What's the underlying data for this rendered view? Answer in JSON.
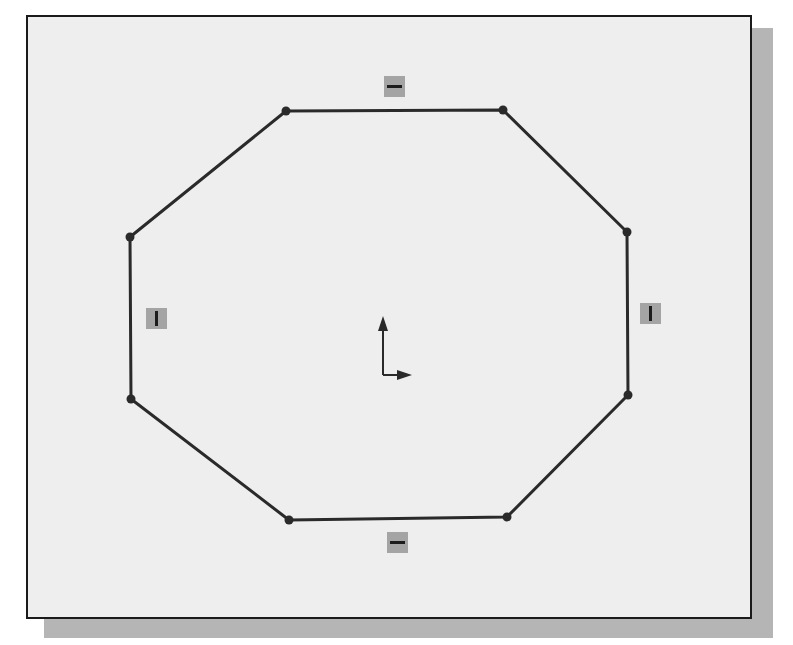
{
  "figure": {
    "colors": {
      "line": "#2a2a2a",
      "background": "#eeeeee",
      "frame_border": "#1a1a1a",
      "shadow": "#b5b5b5",
      "badge_fill": "#a4a4a4"
    },
    "octagon": {
      "vertices": [
        {
          "name": "top-left",
          "x": 286,
          "y": 111
        },
        {
          "name": "top-right",
          "x": 503,
          "y": 110
        },
        {
          "name": "right-top",
          "x": 627,
          "y": 232
        },
        {
          "name": "right-bottom",
          "x": 628,
          "y": 395
        },
        {
          "name": "bottom-right",
          "x": 507,
          "y": 517
        },
        {
          "name": "bottom-left",
          "x": 289,
          "y": 520
        },
        {
          "name": "left-bottom",
          "x": 131,
          "y": 399
        },
        {
          "name": "left-top",
          "x": 130,
          "y": 237
        }
      ]
    },
    "constraints": [
      {
        "name": "horizontal-top",
        "type": "horizontal",
        "x": 384,
        "y": 76
      },
      {
        "name": "vertical-right",
        "type": "vertical",
        "x": 640,
        "y": 303
      },
      {
        "name": "horizontal-bottom",
        "type": "horizontal",
        "x": 387,
        "y": 532
      },
      {
        "name": "vertical-left",
        "type": "vertical",
        "x": 146,
        "y": 308
      }
    ],
    "origin": {
      "x": 383,
      "y": 375
    }
  }
}
